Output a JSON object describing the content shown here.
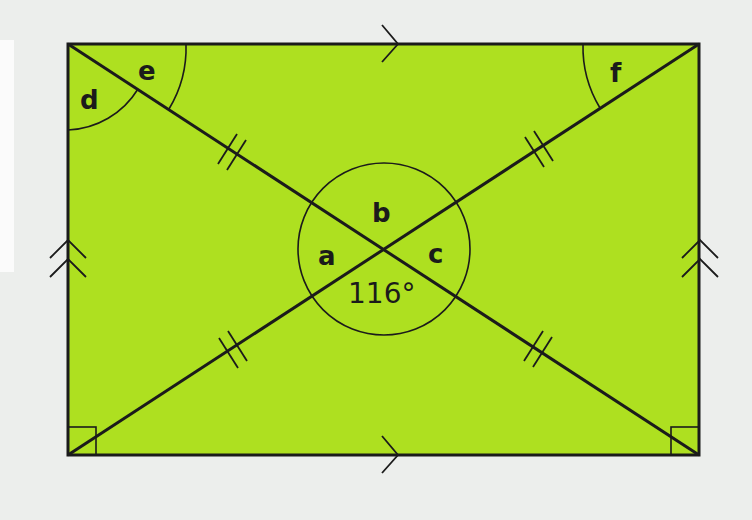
{
  "figure": {
    "shape": "rectangle",
    "fill_color": "#aee020",
    "stroke_color": "#1b1b1b",
    "background_color": "#eceeec",
    "rect": {
      "x1": 68,
      "y1": 44,
      "x2": 699,
      "y2": 455
    },
    "diagonals_intersection": {
      "x": 384,
      "y": 249
    }
  },
  "labels": {
    "a": "a",
    "b": "b",
    "c": "c",
    "d": "d",
    "e": "e",
    "f": "f",
    "given_angle": "116°"
  },
  "markings": {
    "top_bottom_parallel_arrows": 1,
    "left_right_parallel_arrows": 2,
    "diagonal_equal_ticks": 2,
    "right_angles": [
      "bottom-left",
      "bottom-right"
    ]
  }
}
